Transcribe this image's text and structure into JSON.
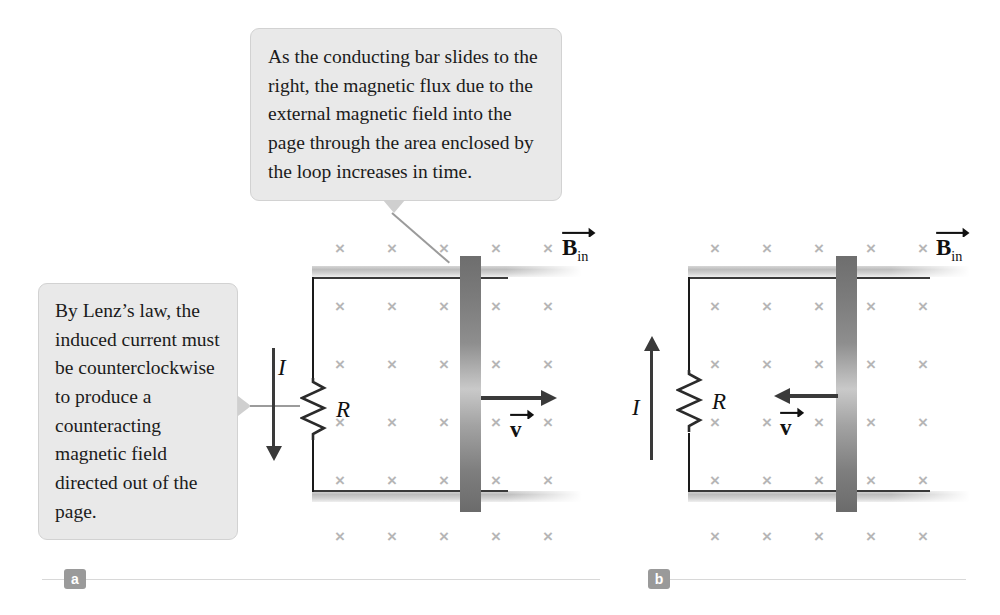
{
  "figure": {
    "callouts": [
      {
        "id": "top",
        "text": "As the conducting bar slides to the right, the magnetic flux due to the external magnetic field into the page through the area enclosed by the loop increases in time."
      },
      {
        "id": "left",
        "text": "By Lenz’s law, the induced current must be counterclockwise to produce a counteracting magnetic field directed out of the page."
      }
    ],
    "panels": [
      {
        "tag": "a",
        "field_label": "B",
        "field_subscript": "in",
        "field_mark": "×",
        "current_label": "I",
        "current_direction": "down",
        "resistor_label": "R",
        "velocity_label": "v",
        "velocity_direction": "right",
        "field_columns": 5,
        "field_rows": 6
      },
      {
        "tag": "b",
        "field_label": "B",
        "field_subscript": "in",
        "field_mark": "×",
        "current_label": "I",
        "current_direction": "up",
        "resistor_label": "R",
        "velocity_label": "v",
        "velocity_direction": "left",
        "field_columns": 5,
        "field_rows": 6
      }
    ],
    "colors": {
      "callout_fill": "#e9e9e9",
      "callout_border": "#d2d2d2",
      "field_mark": "#b6b6b6",
      "bar_dark": "#6e6e6e",
      "rail": "#bdbdbd",
      "wire": "#1a1a1a",
      "arrow": "#3a3a3a",
      "tag_fill": "#9a9a9a"
    }
  }
}
